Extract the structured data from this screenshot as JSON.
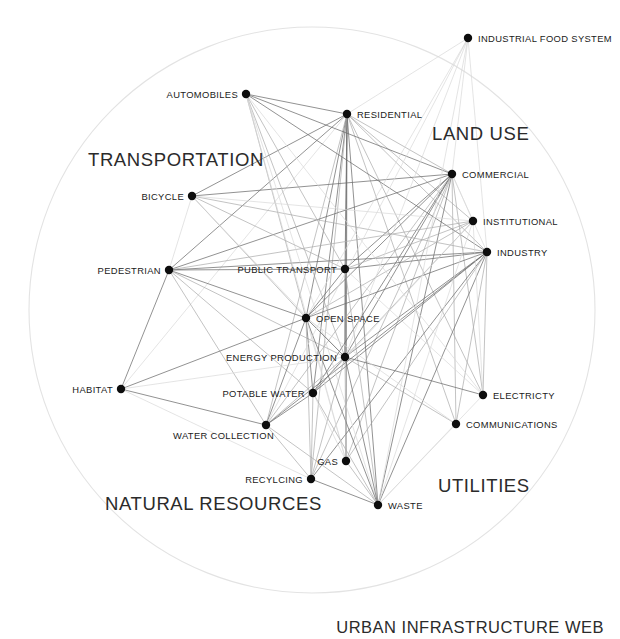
{
  "title": "URBAN INFRASTRUCTURE WEB",
  "canvas": {
    "width": 620,
    "height": 639
  },
  "colors": {
    "background": "#ffffff",
    "node": "#0d0d0d",
    "label": "#1a1a1a",
    "boundary": "#e3e3e3",
    "edge_faint": "#d8d8d8",
    "edge_mid": "#a9a9a9",
    "edge_strong": "#6e6e6e"
  },
  "boundary": {
    "cx": 312,
    "cy": 310,
    "r": 283
  },
  "chart_data": {
    "type": "network",
    "title": "URBAN INFRASTRUCTURE WEB",
    "layout": "radial circle boundary",
    "node_count": 20,
    "edge_count": 96,
    "nodes": [
      {
        "id": "industrial_food_system",
        "label": "INDUSTRIAL FOOD SYSTEM",
        "x": 468,
        "y": 38,
        "label_x": 478,
        "label_y": 42,
        "anchor": "start",
        "group": "land_use"
      },
      {
        "id": "automobiles",
        "label": "AUTOMOBILES",
        "x": 246,
        "y": 94,
        "label_x": 238,
        "label_y": 98,
        "anchor": "end",
        "group": "transportation"
      },
      {
        "id": "residential",
        "label": "RESIDENTIAL",
        "x": 347,
        "y": 114,
        "label_x": 357,
        "label_y": 118,
        "anchor": "start",
        "group": "land_use"
      },
      {
        "id": "commercial",
        "label": "COMMERCIAL",
        "x": 452,
        "y": 174,
        "label_x": 462,
        "label_y": 178,
        "anchor": "start",
        "group": "land_use"
      },
      {
        "id": "bicycle",
        "label": "BICYCLE",
        "x": 192,
        "y": 196,
        "label_x": 184,
        "label_y": 200,
        "anchor": "end",
        "group": "transportation"
      },
      {
        "id": "institutional",
        "label": "INSTITUTIONAL",
        "x": 473,
        "y": 221,
        "label_x": 483,
        "label_y": 225,
        "anchor": "start",
        "group": "land_use"
      },
      {
        "id": "industry",
        "label": "INDUSTRY",
        "x": 487,
        "y": 252,
        "label_x": 497,
        "label_y": 256,
        "anchor": "start",
        "group": "land_use"
      },
      {
        "id": "pedestrian",
        "label": "PEDESTRIAN",
        "x": 169,
        "y": 270,
        "label_x": 161,
        "label_y": 274,
        "anchor": "end",
        "group": "transportation"
      },
      {
        "id": "public_transport",
        "label": "PUBLIC TRANSPORT",
        "x": 345,
        "y": 269,
        "label_x": 337,
        "label_y": 273,
        "anchor": "end",
        "group": "transportation"
      },
      {
        "id": "open_space",
        "label": "OPEN SPACE",
        "x": 306,
        "y": 318,
        "label_x": 316,
        "label_y": 322,
        "anchor": "start",
        "group": "natural_resources"
      },
      {
        "id": "energy_production",
        "label": "ENERGY PRODUCTION",
        "x": 345,
        "y": 357,
        "label_x": 337,
        "label_y": 361,
        "anchor": "end",
        "group": "utilities"
      },
      {
        "id": "habitat",
        "label": "HABITAT",
        "x": 121,
        "y": 389,
        "label_x": 113,
        "label_y": 393,
        "anchor": "end",
        "group": "natural_resources"
      },
      {
        "id": "potable_water",
        "label": "POTABLE WATER",
        "x": 313,
        "y": 393,
        "label_x": 305,
        "label_y": 397,
        "anchor": "end",
        "group": "natural_resources"
      },
      {
        "id": "electricty",
        "label": "ELECTRICTY",
        "x": 483,
        "y": 395,
        "label_x": 493,
        "label_y": 399,
        "anchor": "start",
        "group": "utilities"
      },
      {
        "id": "communications",
        "label": "COMMUNICATIONS",
        "x": 456,
        "y": 424,
        "label_x": 466,
        "label_y": 428,
        "anchor": "start",
        "group": "utilities"
      },
      {
        "id": "water_collection",
        "label": "WATER COLLECTION",
        "x": 266,
        "y": 425,
        "label_x": 274,
        "label_y": 439,
        "anchor": "end",
        "group": "natural_resources"
      },
      {
        "id": "gas",
        "label": "GAS",
        "x": 346,
        "y": 461,
        "label_x": 338,
        "label_y": 465,
        "anchor": "end",
        "group": "utilities"
      },
      {
        "id": "recylcing",
        "label": "RECYLCING",
        "x": 311,
        "y": 479,
        "label_x": 303,
        "label_y": 483,
        "anchor": "end",
        "group": "natural_resources"
      },
      {
        "id": "waste",
        "label": "WASTE",
        "x": 378,
        "y": 505,
        "label_x": 388,
        "label_y": 509,
        "anchor": "start",
        "group": "utilities"
      }
    ],
    "section_labels": [
      {
        "id": "transportation",
        "text": "TRANSPORTATION",
        "x": 88,
        "y": 166
      },
      {
        "id": "land_use",
        "text": "LAND USE",
        "x": 432,
        "y": 140
      },
      {
        "id": "utilities",
        "text": "UTILITIES",
        "x": 438,
        "y": 492
      },
      {
        "id": "natural_resources",
        "text": "NATURAL RESOURCES",
        "x": 105,
        "y": 510
      }
    ],
    "edges": [
      {
        "from": "residential",
        "to": "automobiles",
        "weight": "strong"
      },
      {
        "from": "residential",
        "to": "bicycle",
        "weight": "strong"
      },
      {
        "from": "residential",
        "to": "pedestrian",
        "weight": "strong"
      },
      {
        "from": "residential",
        "to": "public_transport",
        "weight": "strong"
      },
      {
        "from": "residential",
        "to": "commercial",
        "weight": "mid"
      },
      {
        "from": "residential",
        "to": "institutional",
        "weight": "mid"
      },
      {
        "from": "residential",
        "to": "industry",
        "weight": "mid"
      },
      {
        "from": "residential",
        "to": "open_space",
        "weight": "strong"
      },
      {
        "from": "residential",
        "to": "energy_production",
        "weight": "strong"
      },
      {
        "from": "residential",
        "to": "potable_water",
        "weight": "strong"
      },
      {
        "from": "residential",
        "to": "water_collection",
        "weight": "mid"
      },
      {
        "from": "residential",
        "to": "electricty",
        "weight": "mid"
      },
      {
        "from": "residential",
        "to": "communications",
        "weight": "mid"
      },
      {
        "from": "residential",
        "to": "gas",
        "weight": "strong"
      },
      {
        "from": "residential",
        "to": "waste",
        "weight": "strong"
      },
      {
        "from": "residential",
        "to": "recylcing",
        "weight": "mid"
      },
      {
        "from": "residential",
        "to": "industrial_food_system",
        "weight": "faint"
      },
      {
        "from": "residential",
        "to": "habitat",
        "weight": "faint"
      },
      {
        "from": "commercial",
        "to": "automobiles",
        "weight": "strong"
      },
      {
        "from": "commercial",
        "to": "bicycle",
        "weight": "strong"
      },
      {
        "from": "commercial",
        "to": "pedestrian",
        "weight": "strong"
      },
      {
        "from": "commercial",
        "to": "public_transport",
        "weight": "strong"
      },
      {
        "from": "commercial",
        "to": "open_space",
        "weight": "strong"
      },
      {
        "from": "commercial",
        "to": "energy_production",
        "weight": "strong"
      },
      {
        "from": "commercial",
        "to": "potable_water",
        "weight": "strong"
      },
      {
        "from": "commercial",
        "to": "water_collection",
        "weight": "mid"
      },
      {
        "from": "commercial",
        "to": "electricty",
        "weight": "mid"
      },
      {
        "from": "commercial",
        "to": "communications",
        "weight": "mid"
      },
      {
        "from": "commercial",
        "to": "gas",
        "weight": "mid"
      },
      {
        "from": "commercial",
        "to": "waste",
        "weight": "strong"
      },
      {
        "from": "commercial",
        "to": "recylcing",
        "weight": "mid"
      },
      {
        "from": "commercial",
        "to": "industry",
        "weight": "faint"
      },
      {
        "from": "commercial",
        "to": "institutional",
        "weight": "faint"
      },
      {
        "from": "commercial",
        "to": "industrial_food_system",
        "weight": "faint"
      },
      {
        "from": "industry",
        "to": "automobiles",
        "weight": "strong"
      },
      {
        "from": "industry",
        "to": "pedestrian",
        "weight": "strong"
      },
      {
        "from": "industry",
        "to": "public_transport",
        "weight": "strong"
      },
      {
        "from": "industry",
        "to": "bicycle",
        "weight": "mid"
      },
      {
        "from": "industry",
        "to": "open_space",
        "weight": "strong"
      },
      {
        "from": "industry",
        "to": "energy_production",
        "weight": "strong"
      },
      {
        "from": "industry",
        "to": "potable_water",
        "weight": "strong"
      },
      {
        "from": "industry",
        "to": "water_collection",
        "weight": "strong"
      },
      {
        "from": "industry",
        "to": "waste",
        "weight": "strong"
      },
      {
        "from": "industry",
        "to": "recylcing",
        "weight": "strong"
      },
      {
        "from": "industry",
        "to": "gas",
        "weight": "mid"
      },
      {
        "from": "industry",
        "to": "electricty",
        "weight": "mid"
      },
      {
        "from": "industry",
        "to": "communications",
        "weight": "mid"
      },
      {
        "from": "industry",
        "to": "industrial_food_system",
        "weight": "faint"
      },
      {
        "from": "institutional",
        "to": "public_transport",
        "weight": "mid"
      },
      {
        "from": "institutional",
        "to": "open_space",
        "weight": "mid"
      },
      {
        "from": "institutional",
        "to": "pedestrian",
        "weight": "mid"
      },
      {
        "from": "institutional",
        "to": "energy_production",
        "weight": "mid"
      },
      {
        "from": "institutional",
        "to": "potable_water",
        "weight": "faint"
      },
      {
        "from": "institutional",
        "to": "waste",
        "weight": "faint"
      },
      {
        "from": "institutional",
        "to": "electricty",
        "weight": "faint"
      },
      {
        "from": "automobiles",
        "to": "open_space",
        "weight": "mid"
      },
      {
        "from": "automobiles",
        "to": "energy_production",
        "weight": "mid"
      },
      {
        "from": "automobiles",
        "to": "public_transport",
        "weight": "mid"
      },
      {
        "from": "automobiles",
        "to": "waste",
        "weight": "faint"
      },
      {
        "from": "automobiles",
        "to": "gas",
        "weight": "faint"
      },
      {
        "from": "automobiles",
        "to": "electricty",
        "weight": "faint"
      },
      {
        "from": "bicycle",
        "to": "open_space",
        "weight": "mid"
      },
      {
        "from": "bicycle",
        "to": "public_transport",
        "weight": "mid"
      },
      {
        "from": "bicycle",
        "to": "pedestrian",
        "weight": "faint"
      },
      {
        "from": "bicycle",
        "to": "energy_production",
        "weight": "faint"
      },
      {
        "from": "bicycle",
        "to": "institutional",
        "weight": "faint"
      },
      {
        "from": "pedestrian",
        "to": "open_space",
        "weight": "strong"
      },
      {
        "from": "pedestrian",
        "to": "public_transport",
        "weight": "strong"
      },
      {
        "from": "pedestrian",
        "to": "habitat",
        "weight": "strong"
      },
      {
        "from": "pedestrian",
        "to": "energy_production",
        "weight": "mid"
      },
      {
        "from": "pedestrian",
        "to": "potable_water",
        "weight": "mid"
      },
      {
        "from": "pedestrian",
        "to": "water_collection",
        "weight": "mid"
      },
      {
        "from": "public_transport",
        "to": "open_space",
        "weight": "strong"
      },
      {
        "from": "public_transport",
        "to": "energy_production",
        "weight": "strong"
      },
      {
        "from": "public_transport",
        "to": "waste",
        "weight": "mid"
      },
      {
        "from": "public_transport",
        "to": "electricty",
        "weight": "faint"
      },
      {
        "from": "open_space",
        "to": "energy_production",
        "weight": "strong"
      },
      {
        "from": "open_space",
        "to": "potable_water",
        "weight": "strong"
      },
      {
        "from": "open_space",
        "to": "water_collection",
        "weight": "strong"
      },
      {
        "from": "open_space",
        "to": "habitat",
        "weight": "strong"
      },
      {
        "from": "open_space",
        "to": "waste",
        "weight": "strong"
      },
      {
        "from": "open_space",
        "to": "recylcing",
        "weight": "mid"
      },
      {
        "from": "open_space",
        "to": "gas",
        "weight": "faint"
      },
      {
        "from": "energy_production",
        "to": "potable_water",
        "weight": "strong"
      },
      {
        "from": "energy_production",
        "to": "water_collection",
        "weight": "mid"
      },
      {
        "from": "energy_production",
        "to": "electricty",
        "weight": "strong"
      },
      {
        "from": "energy_production",
        "to": "communications",
        "weight": "mid"
      },
      {
        "from": "energy_production",
        "to": "gas",
        "weight": "mid"
      },
      {
        "from": "energy_production",
        "to": "waste",
        "weight": "strong"
      },
      {
        "from": "energy_production",
        "to": "recylcing",
        "weight": "mid"
      },
      {
        "from": "potable_water",
        "to": "water_collection",
        "weight": "strong"
      },
      {
        "from": "potable_water",
        "to": "recylcing",
        "weight": "mid"
      },
      {
        "from": "potable_water",
        "to": "waste",
        "weight": "mid"
      },
      {
        "from": "potable_water",
        "to": "gas",
        "weight": "faint"
      },
      {
        "from": "water_collection",
        "to": "habitat",
        "weight": "strong"
      },
      {
        "from": "water_collection",
        "to": "recylcing",
        "weight": "mid"
      },
      {
        "from": "water_collection",
        "to": "waste",
        "weight": "mid"
      },
      {
        "from": "recylcing",
        "to": "waste",
        "weight": "strong"
      },
      {
        "from": "gas",
        "to": "waste",
        "weight": "mid"
      },
      {
        "from": "industrial_food_system",
        "to": "waste",
        "weight": "faint"
      },
      {
        "from": "industrial_food_system",
        "to": "open_space",
        "weight": "faint"
      },
      {
        "from": "industrial_food_system",
        "to": "energy_production",
        "weight": "faint"
      },
      {
        "from": "industrial_food_system",
        "to": "water_collection",
        "weight": "faint"
      },
      {
        "from": "habitat",
        "to": "recylcing",
        "weight": "faint"
      },
      {
        "from": "habitat",
        "to": "energy_production",
        "weight": "faint"
      },
      {
        "from": "electricty",
        "to": "waste",
        "weight": "faint"
      },
      {
        "from": "communications",
        "to": "waste",
        "weight": "faint"
      },
      {
        "from": "communications",
        "to": "open_space",
        "weight": "faint"
      }
    ]
  }
}
